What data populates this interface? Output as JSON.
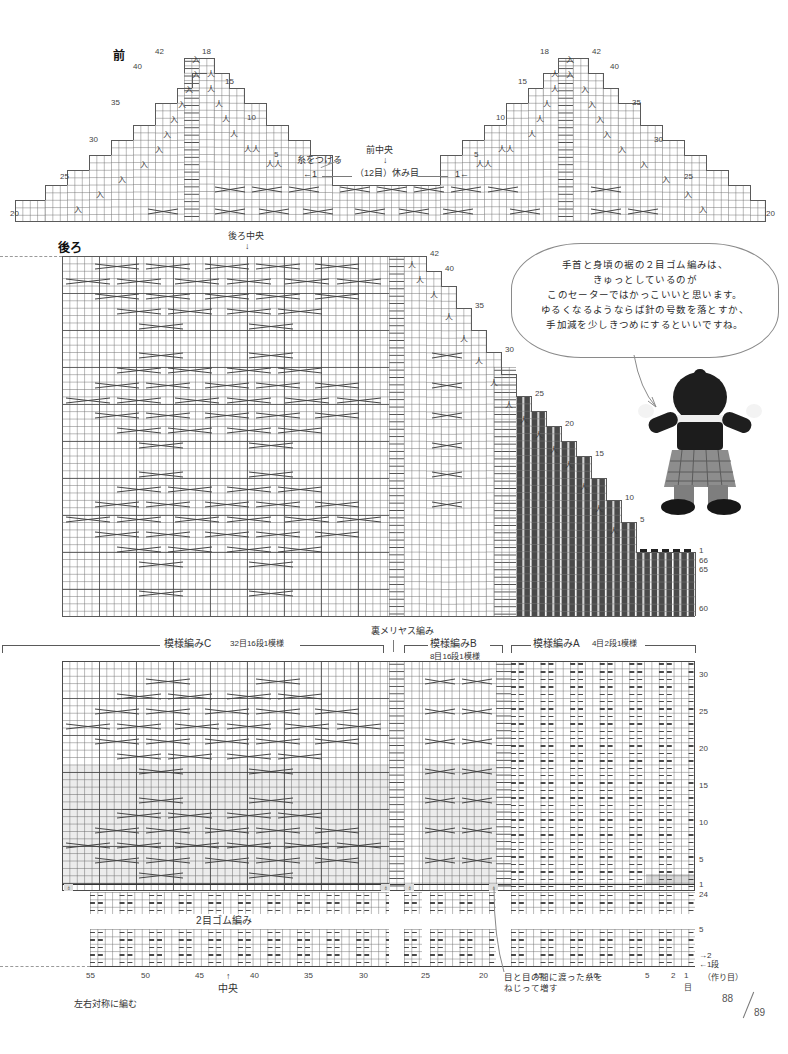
{
  "page": {
    "left_number": "88",
    "right_number": "89"
  },
  "front_chart": {
    "title": "前",
    "center_label": "前中央",
    "center_arrow": "↓",
    "attach_yarn_label": "糸をつける",
    "hold_stitches_label": "（12目）休み目",
    "left_arrow_mark": "←1",
    "right_arrow_mark": "1←",
    "left_row_numbers": [
      "42",
      "40",
      "35",
      "30",
      "25",
      "20"
    ],
    "top_row_numbers": [
      "18",
      "15"
    ],
    "right_row_numbers": [
      "10",
      "5"
    ],
    "mirror_right_numbers": [
      "18",
      "42",
      "40",
      "15",
      "35",
      "10",
      "30",
      "5",
      "25",
      "20"
    ]
  },
  "back_chart": {
    "title": "後ろ",
    "center_label": "後ろ中央",
    "center_arrow": "↓",
    "right_row_numbers": [
      "42",
      "40",
      "35",
      "30",
      "25",
      "20",
      "15",
      "10",
      "5",
      "1",
      "66",
      "65",
      "60"
    ]
  },
  "bubble": {
    "text": "手首と身頃の裾の２目ゴム編みは、\nきゅっとしているのが\nこのセーターではかっこいいと思います。\nゆるくなるようならば針の号数を落とすか、\n手加減を少しきつめにするといいですね。"
  },
  "pattern_bands": [
    {
      "name": "模様編みC",
      "repeat": "32目16段1模様"
    },
    {
      "name": "模様編みB",
      "repeat": "8目16段1模様"
    },
    {
      "name": "模様編みA",
      "repeat": "4目2段1模様"
    }
  ],
  "reverse_stockinette_label": "裏メリヤス編み",
  "body_chart": {
    "row_numbers": [
      "30",
      "25",
      "20",
      "15",
      "10",
      "5",
      "1",
      "24"
    ]
  },
  "rib_chart": {
    "title": "2目ゴム編み",
    "bottom_row_numbers": [
      "5",
      "1"
    ],
    "cast_on_label": "（作り目）",
    "row_direction_up": "→2",
    "row_direction_down": "←1段",
    "stitch_axis": [
      "55",
      "50",
      "45",
      "40",
      "35",
      "30",
      "25",
      "20",
      "15",
      "10",
      "5",
      "2",
      "1"
    ],
    "stitch_unit": "目",
    "center_label": "中央",
    "center_arrow": "↑",
    "symmetry_note": "左右対称に編む",
    "increase_note": "目と目の間に渡った糸を\nねじって増す"
  },
  "colors": {
    "grid_line": "#787878",
    "major_line": "#4a4a4a",
    "outline": "#4a4a4a",
    "shade": "rgba(0,0,0,0.075)",
    "text": "#333333"
  }
}
